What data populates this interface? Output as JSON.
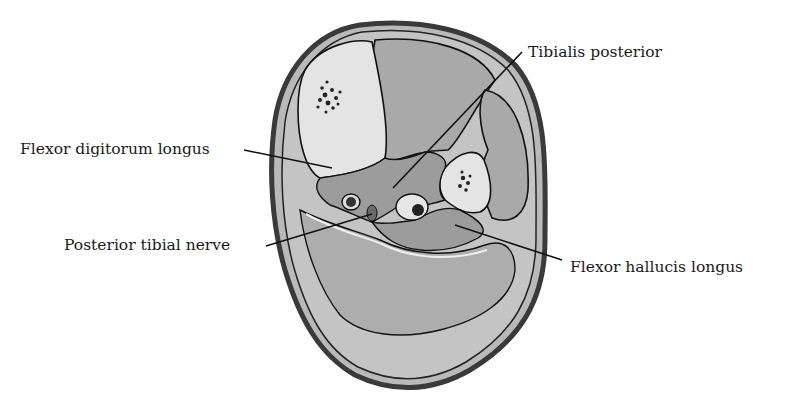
{
  "figure": {
    "labels": [
      {
        "id": "tibialis-posterior",
        "text": "Tibialis posterior"
      },
      {
        "id": "flexor-digitorum-longus",
        "text": "Flexor digitorum longus"
      },
      {
        "id": "posterior-tibial-nerve",
        "text": "Posterior tibial nerve"
      },
      {
        "id": "flexor-hallucis-longus",
        "text": "Flexor hallucis longus"
      }
    ],
    "colors": {
      "skin_outline": "#3a3a3a",
      "subcutaneous": "#b9b9b9",
      "muscle": "#a9a9a9",
      "deep_muscle": "#9c9c9c",
      "bone": "#e4e4e4",
      "marrow": "#222222",
      "fascia": "#efefef",
      "line": "#111111"
    }
  }
}
